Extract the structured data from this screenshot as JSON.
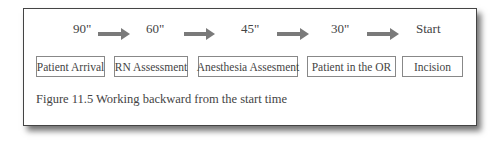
{
  "diagram": {
    "times": [
      "90\"",
      "60\"",
      "45\"",
      "30\"",
      "Start"
    ],
    "steps": [
      "Patient Arrival",
      "RN Assessment",
      "Anesthesia Assesment",
      "Patient in the OR",
      "Incision"
    ],
    "arrow_color": "#7a7a7a",
    "caption": "Figure 11.5 Working backward from the start time"
  }
}
